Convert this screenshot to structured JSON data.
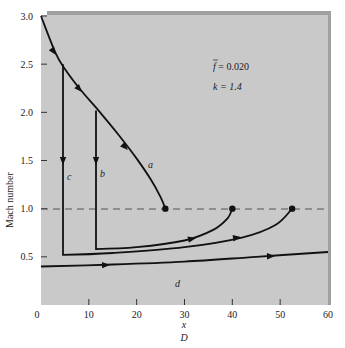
{
  "chart_data": {
    "type": "line",
    "title": "",
    "annotations": {
      "friction": "f̄ = 0.020",
      "friction_bar": "f",
      "friction_value": "= 0.020",
      "k": "k = 1.4"
    },
    "xlabel_top": "x",
    "xlabel_bottom": "D",
    "ylabel": "Mach number",
    "xlim": [
      0,
      60
    ],
    "ylim": [
      0,
      3.0
    ],
    "xticks": [
      "0",
      "10",
      "20",
      "30",
      "40",
      "50",
      "60"
    ],
    "yticks": [
      "0.5",
      "1.0",
      "1.5",
      "2.0",
      "2.5",
      "3.0"
    ],
    "grid": false,
    "reference_line": {
      "y": 1.0,
      "style": "dashed"
    },
    "series": [
      {
        "name": "a",
        "points": [
          [
            0,
            3.0
          ],
          [
            3,
            2.62
          ],
          [
            5,
            2.45
          ],
          [
            8,
            2.25
          ],
          [
            12,
            2.02
          ],
          [
            16,
            1.78
          ],
          [
            20,
            1.52
          ],
          [
            23,
            1.3
          ],
          [
            25,
            1.12
          ],
          [
            26,
            1.0
          ]
        ],
        "end_marker": [
          26,
          1.0
        ]
      },
      {
        "name": "b",
        "points": [
          [
            11.5,
            2.02
          ],
          [
            11.5,
            0.58
          ],
          [
            20,
            0.6
          ],
          [
            30,
            0.67
          ],
          [
            36,
            0.78
          ],
          [
            39,
            0.9
          ],
          [
            40,
            1.0
          ]
        ],
        "end_marker": [
          40,
          1.0
        ]
      },
      {
        "name": "c",
        "points": [
          [
            4.6,
            2.5
          ],
          [
            4.6,
            0.52
          ],
          [
            15,
            0.54
          ],
          [
            30,
            0.6
          ],
          [
            42,
            0.7
          ],
          [
            49,
            0.83
          ],
          [
            52.5,
            1.0
          ]
        ],
        "end_marker": [
          52.5,
          1.0
        ]
      },
      {
        "name": "d",
        "points": [
          [
            0,
            0.4
          ],
          [
            15,
            0.42
          ],
          [
            30,
            0.45
          ],
          [
            45,
            0.5
          ],
          [
            60,
            0.55
          ]
        ]
      }
    ],
    "curve_labels": [
      "a",
      "b",
      "c",
      "d"
    ]
  },
  "colors": {
    "plot_bg": "#c8c8c8",
    "plot_border": "#9a9a9a",
    "line": "#111111",
    "dashed": "#555555"
  }
}
